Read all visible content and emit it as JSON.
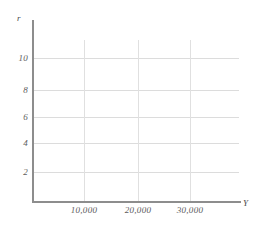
{
  "chart_data": {
    "type": "line",
    "title": "",
    "subtitle": "",
    "xlabel": "Y",
    "ylabel": "r",
    "grid": true,
    "legend": null,
    "series": [],
    "annotations": [],
    "x_axis": {
      "label": "Y",
      "tick_labels": [
        "10,000",
        "20,000",
        "30,000"
      ],
      "tick_values": [
        10000,
        20000,
        30000
      ],
      "xlim": [
        0,
        38000
      ]
    },
    "y_axis": {
      "label": "r",
      "tick_labels": [
        "10",
        "8",
        "6",
        "4",
        "2"
      ],
      "tick_values": [
        10,
        8,
        6,
        4,
        2
      ],
      "ylim": [
        0,
        12
      ]
    }
  },
  "axes": {
    "y_name": "r",
    "x_name": "Y"
  },
  "yticks": [
    {
      "label": "10",
      "top": 53
    },
    {
      "label": "8",
      "top": 85
    },
    {
      "label": "6",
      "top": 112
    },
    {
      "label": "4",
      "top": 138
    },
    {
      "label": "2",
      "top": 167
    }
  ],
  "hgrid": [
    {
      "top": 58
    },
    {
      "top": 90
    },
    {
      "top": 117
    },
    {
      "top": 143
    },
    {
      "top": 172
    }
  ],
  "xticks": [
    {
      "label": "10,000",
      "left": 84
    },
    {
      "label": "20,000",
      "left": 138
    },
    {
      "label": "30,000",
      "left": 190
    }
  ],
  "vgrid": [
    {
      "left": 84,
      "height": 162
    },
    {
      "left": 138,
      "height": 162
    },
    {
      "left": 190,
      "height": 162
    }
  ],
  "colors": {
    "background": "#ffffff",
    "axis": "#8d8d8d",
    "gridline_horizontal": "#dcdcdc",
    "gridline_vertical": "#e0e0e0",
    "tick_text": "#5c5c5c",
    "axis_label_text": "#4a4a4a"
  }
}
